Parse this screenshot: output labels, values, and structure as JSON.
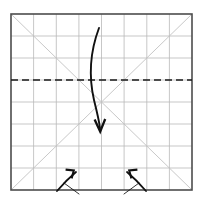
{
  "figure": {
    "type": "origami-fold-diagram",
    "background_color": "#ffffff",
    "canvas": {
      "width": 203,
      "height": 202
    }
  },
  "paper": {
    "label": "Square sheet outline",
    "x": 11,
    "y": 14,
    "width": 181,
    "height": 176,
    "border_color": "#4d4d4d",
    "border_width": 1.6
  },
  "grid": {
    "label": "8 by 8 crease grid",
    "columns": 8,
    "rows": 8,
    "line_color": "#b9b9b9",
    "line_width": 0.8,
    "vertical_x": [
      33.6,
      56.3,
      78.9,
      101.5,
      124.1,
      146.8,
      169.4
    ],
    "horizontal_y": [
      36.0,
      58.0,
      80.0,
      102.0,
      124.0,
      146.0,
      168.0
    ]
  },
  "diagonals": {
    "label": "Corner to corner crease diagonals",
    "line_color": "#c2c2c2",
    "line_width": 0.9,
    "lines": [
      {
        "name": "diagonal-tl-br",
        "x1": 11,
        "y1": 14,
        "x2": 192,
        "y2": 190
      },
      {
        "name": "diagonal-bl-tr",
        "x1": 11,
        "y1": 190,
        "x2": 192,
        "y2": 14
      }
    ]
  },
  "fold_line": {
    "label": "Horizontal valley fold line",
    "style": "dashed",
    "color": "#1a1a1a",
    "line_width": 1.7,
    "dash_pattern": "7 4",
    "x1": 11,
    "y1": 80,
    "x2": 192,
    "y2": 80
  },
  "main_arrow": {
    "label": "Large fold-down arrow",
    "color": "#111111",
    "line_width": 1.9,
    "path": "M 99 28 C 90 52, 89 78, 94 100 C 97 112, 99 120, 100 128",
    "head": "M 94.6 119.4 L 100.2 131.6 L 105.2 119.0",
    "start_point": {
      "x": 99,
      "y": 28
    },
    "end_point": {
      "x": 100,
      "y": 130
    },
    "direction": "down"
  },
  "small_arrows": [
    {
      "name": "fold-unfold-arrow-left",
      "label": "Fold and unfold arrow, points up-left",
      "color": "#111111",
      "line_width": 1.8,
      "curve": "M 57 191 C 63 184, 70 177, 76 172",
      "head": "M 65.6 169.6 L 73.8 170.5 L 71.6 178.4",
      "tick": "M 64 183 L 79 194",
      "tip": {
        "x": 69,
        "y": 172
      }
    },
    {
      "name": "fold-unfold-arrow-right",
      "label": "Fold and unfold arrow, points up-right",
      "color": "#111111",
      "line_width": 1.8,
      "curve": "M 146 191 C 140 184, 133 177, 127 172",
      "head": "M 137.4 169.6 L 129.2 170.5 L 131.4 178.4",
      "tick": "M 139 183 L 124 194",
      "tip": {
        "x": 134,
        "y": 172
      }
    }
  ]
}
